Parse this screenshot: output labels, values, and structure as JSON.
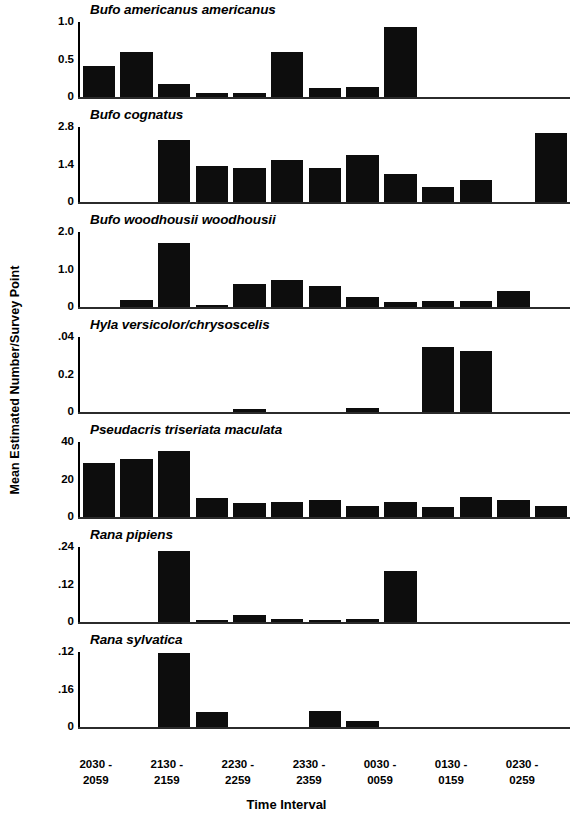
{
  "chart_data": {
    "type": "bar",
    "title": "",
    "xlabel": "Time Interval",
    "ylabel": "Mean Estimated Number/Survey Point",
    "grid": false,
    "legend": "none",
    "layout": "7 stacked panels sharing one x axis; one panel per species",
    "categories": [
      "2030 - 2059",
      "2100 - 2129",
      "2130 - 2159",
      "2200 - 2229",
      "2230 - 2259",
      "2300 - 2329",
      "2330 - 2359",
      "0000 - 0029",
      "0030 - 0059",
      "0100 - 0129",
      "0130 - 0159",
      "0200 - 0229",
      "0230 - 0259"
    ],
    "tick_labels": [
      {
        "line1": "2030 -",
        "line2": "2059"
      },
      {
        "line1": "2130 -",
        "line2": "2159"
      },
      {
        "line1": "2230 -",
        "line2": "2259"
      },
      {
        "line1": "2330 -",
        "line2": "2359"
      },
      {
        "line1": "0030 -",
        "line2": "0059"
      },
      {
        "line1": "0130 -",
        "line2": "0159"
      },
      {
        "line1": "0230 -",
        "line2": "0259"
      }
    ],
    "panels": [
      {
        "name": "Bufo americanus americanus",
        "ylim": [
          0,
          1.0
        ],
        "yticks": [
          "1.0",
          "0.5",
          "0"
        ],
        "ytick_values": [
          1.0,
          0.5,
          0
        ],
        "values": [
          0.42,
          0.6,
          0.18,
          0.05,
          0.06,
          0.6,
          0.12,
          0.14,
          0.94,
          0,
          0,
          0,
          0
        ]
      },
      {
        "name": "Bufo cognatus",
        "ylim": [
          0,
          2.8
        ],
        "yticks": [
          "2.8",
          "1.4",
          "0"
        ],
        "ytick_values": [
          2.8,
          1.4,
          0
        ],
        "values": [
          0,
          0,
          2.33,
          1.33,
          1.26,
          1.58,
          1.26,
          1.76,
          1.06,
          0.55,
          0.83,
          0,
          2.58
        ]
      },
      {
        "name": "Bufo woodhousii woodhousii",
        "ylim": [
          0,
          2.0
        ],
        "yticks": [
          "2.0",
          "1.0",
          "0"
        ],
        "ytick_values": [
          2.0,
          1.0,
          0
        ],
        "values": [
          0,
          0.18,
          1.7,
          0.05,
          0.62,
          0.73,
          0.55,
          0.26,
          0.14,
          0.15,
          0.15,
          0.43,
          0
        ]
      },
      {
        "name": "Hyla versicolor/chrysoscelis",
        "ylim": [
          0,
          0.04
        ],
        "yticks": [
          ".04",
          "0.2",
          "0"
        ],
        "ytick_values": [
          0.04,
          0.02,
          0
        ],
        "values": [
          0,
          0,
          0,
          0,
          0.0018,
          0,
          0,
          0.002,
          0,
          0.0345,
          0.0325,
          0,
          0
        ]
      },
      {
        "name": "Pseudacris triseriata maculata",
        "ylim": [
          0,
          40
        ],
        "yticks": [
          "40",
          "20",
          "0"
        ],
        "ytick_values": [
          40,
          20,
          0
        ],
        "values": [
          29,
          31,
          35,
          10,
          7.5,
          8,
          9,
          6,
          8,
          5.5,
          10.5,
          9,
          6
        ]
      },
      {
        "name": "Rana pipiens",
        "ylim": [
          0,
          0.24
        ],
        "yticks": [
          ".24",
          ".12",
          "0"
        ],
        "ytick_values": [
          0.24,
          0.12,
          0
        ],
        "values": [
          0,
          0,
          0.228,
          0.008,
          0.021,
          0.011,
          0.006,
          0.009,
          0.163,
          0,
          0,
          0,
          0
        ]
      },
      {
        "name": "Rana sylvatica",
        "ylim": [
          0,
          0.12
        ],
        "yticks": [
          ".12",
          ".16",
          "0"
        ],
        "ytick_values": [
          0.12,
          0.06,
          0
        ],
        "values": [
          0,
          0,
          0.118,
          0.024,
          0,
          0,
          0.025,
          0.009,
          0,
          0,
          0,
          0,
          0
        ]
      }
    ]
  },
  "axis": {
    "y_title": "Mean Estimated Number/Survey Point",
    "x_title": "Time Interval"
  }
}
